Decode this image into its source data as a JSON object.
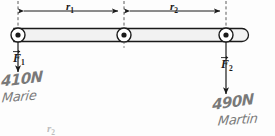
{
  "diagram": {
    "rod": {
      "left_end_x": 18,
      "right_end_x": 249,
      "y": 35,
      "thickness": 13
    },
    "pivots": [
      {
        "name": "left-pivot",
        "x": 18,
        "y": 35
      },
      {
        "name": "middle-pivot",
        "x": 124,
        "y": 35
      },
      {
        "name": "right-pivot",
        "x": 226,
        "y": 35
      }
    ],
    "dimensions": [
      {
        "id": "r1",
        "label": "r",
        "subscript": "1",
        "from_x": 18,
        "to_x": 124,
        "y": 11
      },
      {
        "id": "r2",
        "label": "r",
        "subscript": "2",
        "from_x": 124,
        "to_x": 226,
        "y": 11
      }
    ],
    "forces": [
      {
        "id": "F1",
        "label": "F",
        "subscript": "1",
        "x": 18,
        "from_y": 42,
        "to_y": 78,
        "direction": "down"
      },
      {
        "id": "F2",
        "label": "F",
        "subscript": "2",
        "x": 226,
        "from_y": 42,
        "to_y": 100,
        "direction": "down"
      }
    ]
  },
  "annotations": {
    "left_magnitude": "410N",
    "left_name": "Marie",
    "right_magnitude": "490N",
    "right_name": "Martin",
    "bottom_partial": "r",
    "bottom_partial_sub": "2"
  },
  "colors": {
    "ink": "#1a1a1a",
    "rod_fill": "#f2f2f2",
    "rod_stroke": "#1a1a1a",
    "pencil": "#555555",
    "background": "#fdfdfd",
    "faint": "#8a8a8a"
  }
}
